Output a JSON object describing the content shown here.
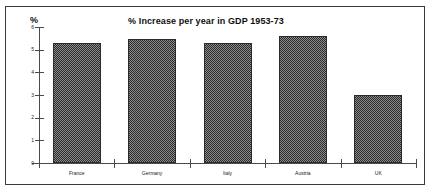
{
  "chart_data": {
    "type": "bar",
    "title": "% Increase per year in GDP 1953-73",
    "xlabel": "",
    "ylabel": "%",
    "ylim": [
      0,
      6
    ],
    "yticks": [
      "0",
      "1",
      "2",
      "3",
      "4",
      "5",
      "6"
    ],
    "grid": false,
    "legend": null,
    "categories": [
      "France",
      "Germany",
      "Italy",
      "Austria",
      "UK"
    ],
    "values": [
      5.3,
      5.45,
      5.3,
      5.6,
      3.0
    ],
    "series": [
      {
        "name": "% Increase per year in GDP 1953-73",
        "values": [
          5.3,
          5.45,
          5.3,
          5.6,
          3.0
        ]
      }
    ],
    "bar_color": "#3d3d3d",
    "bar_pattern": "checkerboard-dither"
  },
  "axis": {
    "y_label": "%",
    "ticks": [
      {
        "label": "6",
        "value": 6
      },
      {
        "label": "5",
        "value": 5
      },
      {
        "label": "4",
        "value": 4
      },
      {
        "label": "3",
        "value": 3
      },
      {
        "label": "2",
        "value": 2
      },
      {
        "label": "1",
        "value": 1
      },
      {
        "label": "0",
        "value": 0
      }
    ]
  },
  "bars": [
    {
      "label": "France",
      "value": 5.3
    },
    {
      "label": "Germany",
      "value": 5.45
    },
    {
      "label": "Italy",
      "value": 5.3
    },
    {
      "label": "Austria",
      "value": 5.6
    },
    {
      "label": "UK",
      "value": 3.0
    }
  ]
}
